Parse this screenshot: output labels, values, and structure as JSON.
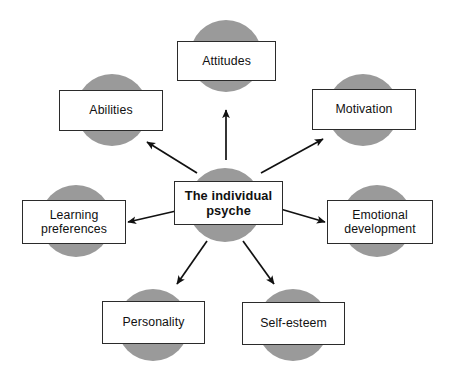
{
  "diagram": {
    "type": "radial-hub-and-spoke",
    "colors": {
      "circle_fill": "#9a9a9a",
      "box_fill": "#ffffff",
      "box_border": "#2b2b2b",
      "arrow": "#111111",
      "background": "#ffffff",
      "text": "#111111"
    },
    "center": {
      "label": "The individual\npsyche",
      "line1": "The individual",
      "line2": "psyche",
      "circle": {
        "cx": 225,
        "cy": 205,
        "r": 37
      },
      "box": {
        "x": 174,
        "y": 181,
        "w": 109,
        "h": 44
      }
    },
    "nodes": [
      {
        "id": "attitudes",
        "label": "Attitudes",
        "circle": {
          "cx": 226,
          "cy": 56,
          "r": 36
        },
        "box": {
          "x": 177,
          "y": 41,
          "w": 99,
          "h": 40
        },
        "arrow": {
          "x1": 226,
          "y1": 160,
          "x2": 226,
          "y2": 110
        }
      },
      {
        "id": "abilities",
        "label": "Abilities",
        "circle": {
          "cx": 112,
          "cy": 110,
          "r": 36
        },
        "box": {
          "x": 59,
          "y": 90,
          "w": 104,
          "h": 41
        },
        "arrow": {
          "x1": 197,
          "y1": 173,
          "x2": 147,
          "y2": 142
        }
      },
      {
        "id": "motivation",
        "label": "Motivation",
        "circle": {
          "cx": 363,
          "cy": 110,
          "r": 36
        },
        "box": {
          "x": 312,
          "y": 89,
          "w": 104,
          "h": 41
        },
        "arrow": {
          "x1": 261,
          "y1": 173,
          "x2": 323,
          "y2": 139
        }
      },
      {
        "id": "learning-preferences",
        "label": "Learning\npreferences",
        "line1": "Learning",
        "line2": "preferences",
        "circle": {
          "cx": 76,
          "cy": 221,
          "r": 36
        },
        "box": {
          "x": 22,
          "y": 200,
          "w": 104,
          "h": 44
        },
        "arrow": {
          "x1": 189,
          "y1": 208,
          "x2": 128,
          "y2": 222
        }
      },
      {
        "id": "emotional-development",
        "label": "Emotional\ndevelopment",
        "line1": "Emotional",
        "line2": "development",
        "circle": {
          "cx": 377,
          "cy": 221,
          "r": 36
        },
        "box": {
          "x": 327,
          "y": 200,
          "w": 106,
          "h": 44
        },
        "arrow": {
          "x1": 277,
          "y1": 208,
          "x2": 325,
          "y2": 222
        }
      },
      {
        "id": "personality",
        "label": "Personality",
        "circle": {
          "cx": 153,
          "cy": 325,
          "r": 36
        },
        "box": {
          "x": 102,
          "y": 301,
          "w": 103,
          "h": 43
        },
        "arrow": {
          "x1": 207,
          "y1": 241,
          "x2": 177,
          "y2": 284
        }
      },
      {
        "id": "self-esteem",
        "label": "Self-esteem",
        "circle": {
          "cx": 293,
          "cy": 325,
          "r": 36
        },
        "box": {
          "x": 242,
          "y": 302,
          "w": 103,
          "h": 43
        },
        "arrow": {
          "x1": 243,
          "y1": 241,
          "x2": 274,
          "y2": 284
        }
      }
    ]
  }
}
